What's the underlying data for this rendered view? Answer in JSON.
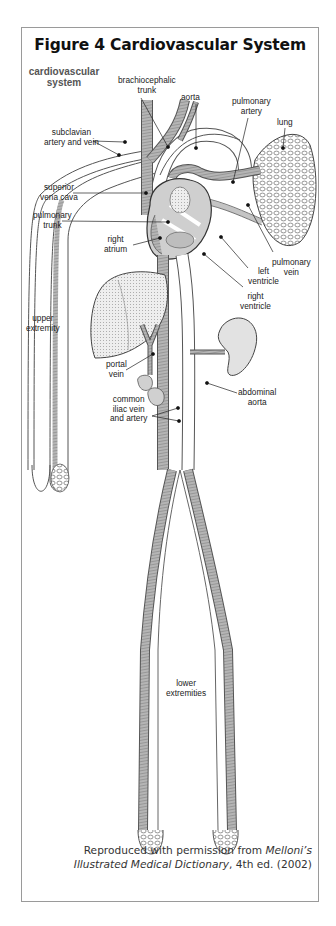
{
  "figure": {
    "title": "Figure 4  Cardiovascular System",
    "section_label": "cardiovascular system"
  },
  "labels": {
    "brachiocephalic_trunk": [
      "brachiocephalic",
      "trunk"
    ],
    "aorta": "aorta",
    "pulmonary_artery": [
      "pulmonary",
      "artery"
    ],
    "lung": "lung",
    "subclavian": [
      "subclavian",
      "artery and vein"
    ],
    "superior_vena_cava": [
      "superior",
      "vena cava"
    ],
    "pulmonary_trunk": [
      "pulmonary",
      "trunk"
    ],
    "right_atrium": [
      "right",
      "atrium"
    ],
    "pulmonary_vein": [
      "pulmonary",
      "vein"
    ],
    "left_ventricle": [
      "left",
      "ventricle"
    ],
    "right_ventricle": [
      "right",
      "ventricle"
    ],
    "upper_extremity": [
      "upper",
      "extremity"
    ],
    "portal_vein": [
      "portal",
      "vein"
    ],
    "abdominal_aorta": [
      "abdominal",
      "aorta"
    ],
    "common_iliac": [
      "common",
      "iliac vein",
      "and artery"
    ],
    "lower_extremities": [
      "lower",
      "extremities"
    ]
  },
  "credit": {
    "line1_prefix": "Reproduced with permission from ",
    "line1_italic": "Melloni’s",
    "line2_italic": "Illustrated Medical Dictionary",
    "line2_suffix": ", 4th ed. (2002)"
  },
  "colors": {
    "frame_border": "#9a9a9a",
    "vessel_fill": "#a8a8a8",
    "vessel_outline": "#555555",
    "organ_fill": "#d9d9d9",
    "label_text": "#222222",
    "section_text": "#555555"
  }
}
